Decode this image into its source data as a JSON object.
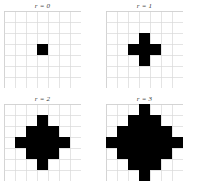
{
  "figure": {
    "background_color": "#ffffff",
    "cell_color": "#000000",
    "grid_color": "#d9d9d9"
  },
  "panels": [
    {
      "id": "panel-0",
      "label": "r = 0",
      "radius": 0,
      "grid_cols": 7,
      "grid_rows": 7,
      "cell_px": 11,
      "center": [
        3,
        3
      ],
      "filled_cells": [
        [
          3,
          3
        ]
      ],
      "filled_count": 1,
      "row_widths": [
        1
      ]
    },
    {
      "id": "panel-1",
      "label": "r = 1",
      "radius": 1,
      "grid_cols": 7,
      "grid_rows": 7,
      "cell_px": 11,
      "center": [
        3,
        3
      ],
      "filled_cells": [
        [
          3,
          2
        ],
        [
          2,
          3
        ],
        [
          3,
          3
        ],
        [
          4,
          3
        ],
        [
          3,
          4
        ]
      ],
      "filled_count": 5,
      "row_widths": [
        1,
        3,
        1
      ]
    },
    {
      "id": "panel-2",
      "label": "r = 2",
      "radius": 2,
      "grid_cols": 7,
      "grid_rows": 7,
      "cell_px": 11,
      "center": [
        3,
        3
      ],
      "filled_cells": [
        [
          3,
          1
        ],
        [
          2,
          2
        ],
        [
          3,
          2
        ],
        [
          4,
          2
        ],
        [
          1,
          3
        ],
        [
          2,
          3
        ],
        [
          3,
          3
        ],
        [
          4,
          3
        ],
        [
          5,
          3
        ],
        [
          2,
          4
        ],
        [
          3,
          4
        ],
        [
          4,
          4
        ],
        [
          3,
          5
        ]
      ],
      "filled_count": 13,
      "row_widths": [
        1,
        3,
        5,
        3,
        1
      ]
    },
    {
      "id": "panel-3",
      "label": "r = 3",
      "radius": 3,
      "grid_cols": 7,
      "grid_rows": 7,
      "cell_px": 11,
      "center": [
        3,
        3
      ],
      "filled_cells": [
        [
          3,
          0
        ],
        [
          2,
          1
        ],
        [
          3,
          1
        ],
        [
          4,
          1
        ],
        [
          1,
          2
        ],
        [
          2,
          2
        ],
        [
          3,
          2
        ],
        [
          4,
          2
        ],
        [
          5,
          2
        ],
        [
          0,
          3
        ],
        [
          1,
          3
        ],
        [
          2,
          3
        ],
        [
          3,
          3
        ],
        [
          4,
          3
        ],
        [
          5,
          3
        ],
        [
          6,
          3
        ],
        [
          1,
          4
        ],
        [
          2,
          4
        ],
        [
          3,
          4
        ],
        [
          4,
          4
        ],
        [
          5,
          4
        ],
        [
          2,
          5
        ],
        [
          3,
          5
        ],
        [
          4,
          5
        ],
        [
          3,
          6
        ]
      ],
      "filled_count": 25,
      "row_widths": [
        1,
        3,
        5,
        7,
        5,
        3,
        1
      ]
    }
  ]
}
